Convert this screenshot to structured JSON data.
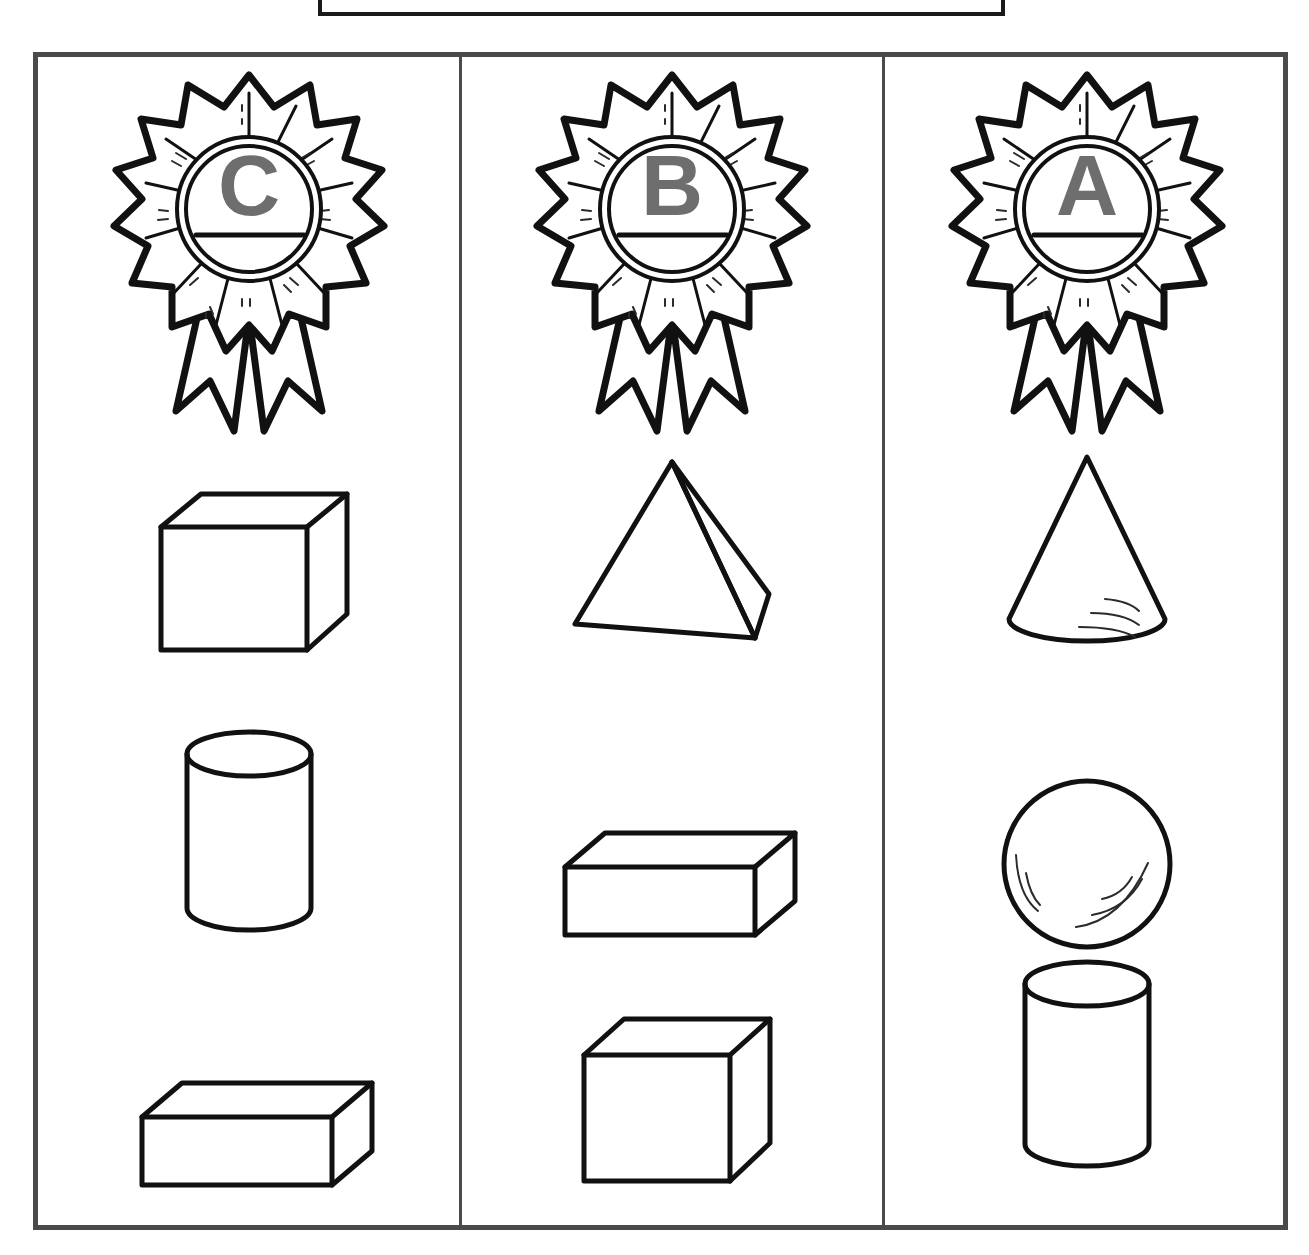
{
  "worksheet": {
    "title_text": "",
    "frame_color": "#4a4a4a",
    "ink_color": "#111111",
    "letter_color": "#6e6e6e",
    "columns": [
      {
        "badge": {
          "letter": "C",
          "icon": "award-ribbon-rosette-icon",
          "has_name_line": true
        },
        "shapes": [
          {
            "name": "cube",
            "label": "cube"
          },
          {
            "name": "cylinder",
            "label": "cylinder"
          },
          {
            "name": "rectangular-prism",
            "label": "rectangular prism"
          }
        ]
      },
      {
        "badge": {
          "letter": "B",
          "icon": "award-ribbon-rosette-icon",
          "has_name_line": true
        },
        "shapes": [
          {
            "name": "square-pyramid",
            "label": "pyramid"
          },
          {
            "name": "rectangular-prism",
            "label": "rectangular prism"
          },
          {
            "name": "cube",
            "label": "cube"
          }
        ]
      },
      {
        "badge": {
          "letter": "A",
          "icon": "award-ribbon-rosette-icon",
          "has_name_line": true
        },
        "shapes": [
          {
            "name": "cone",
            "label": "cone"
          },
          {
            "name": "sphere",
            "label": "sphere"
          },
          {
            "name": "cylinder",
            "label": "cylinder"
          }
        ]
      }
    ]
  }
}
